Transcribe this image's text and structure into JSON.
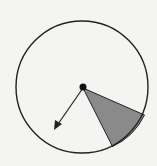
{
  "diagram": {
    "type": "spinner",
    "colors": {
      "background": "#f4f4f2",
      "outline": "#222222",
      "shaded_sector": "#8a8a8a",
      "pointer": "#222222"
    },
    "circle": {
      "cx": 82,
      "cy": 87,
      "r": 66
    },
    "shaded_sector": {
      "start": [
        145,
        115
      ],
      "end": [
        112,
        148
      ]
    },
    "pointer": {
      "tip": [
        54,
        130
      ]
    }
  }
}
